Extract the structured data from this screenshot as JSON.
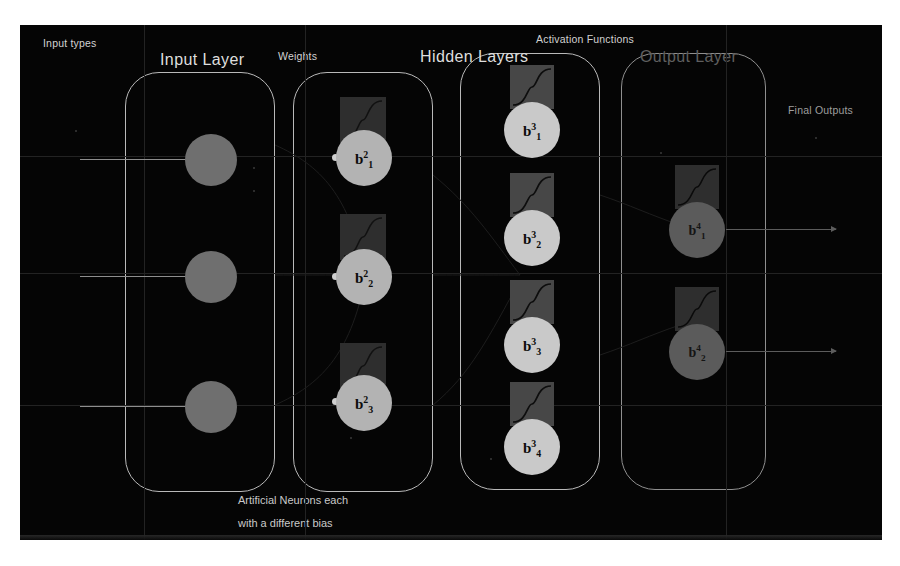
{
  "diagram": {
    "background_color": "#050505",
    "page_color": "#ffffff"
  },
  "labels": {
    "input_types": "Input types",
    "weights": "Weights",
    "activation_functions": "Activation Functions",
    "final_outputs": "Final Outputs",
    "caption_line1": "Artificial Neurons each",
    "caption_line2": "with a different bias"
  },
  "headings": {
    "input_layer": "Input Layer",
    "hidden_layers": "Hidden Layers",
    "output_layer": "Output Layer"
  },
  "layers": {
    "input": {
      "name": "Input Layer",
      "neuron_count": 3,
      "neurons": [
        {
          "label": ""
        },
        {
          "label": ""
        },
        {
          "label": ""
        }
      ],
      "color": "#6f6f6f"
    },
    "weights": {
      "name": "Weights",
      "neuron_count": 3,
      "neurons": [
        {
          "base": "b",
          "superscript": "2",
          "subscript": "1"
        },
        {
          "base": "b",
          "superscript": "2",
          "subscript": "2"
        },
        {
          "base": "b",
          "superscript": "2",
          "subscript": "3"
        }
      ],
      "color": "#b3b3b3"
    },
    "hidden": {
      "name": "Hidden Layers",
      "neuron_count": 4,
      "neurons": [
        {
          "base": "b",
          "superscript": "3",
          "subscript": "1"
        },
        {
          "base": "b",
          "superscript": "3",
          "subscript": "2"
        },
        {
          "base": "b",
          "superscript": "3",
          "subscript": "3"
        },
        {
          "base": "b",
          "superscript": "3",
          "subscript": "4"
        }
      ],
      "color": "#c9c9c9"
    },
    "output": {
      "name": "Output Layer",
      "neuron_count": 2,
      "neurons": [
        {
          "base": "b",
          "superscript": "4",
          "subscript": "1"
        },
        {
          "base": "b",
          "superscript": "4",
          "subscript": "2"
        }
      ],
      "color": "#5b5b5b"
    }
  },
  "icons": {
    "activation": "sigmoid-curve-icon",
    "input_arrow": "arrow-right-icon",
    "output_arrow": "arrow-right-icon"
  },
  "counts": {
    "input_arrows": 3,
    "output_arrows": 2,
    "activation_tiles": 9
  }
}
